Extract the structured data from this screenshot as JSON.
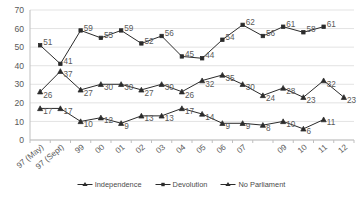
{
  "chart_data": {
    "type": "line",
    "title": "",
    "subtitle": "",
    "xlabel": "",
    "ylabel": "",
    "ylim": [
      0,
      70
    ],
    "ytick_step": 10,
    "yticks": [
      "0",
      "10",
      "20",
      "30",
      "40",
      "50",
      "60",
      "70"
    ],
    "grid": true,
    "grid_axis": "y",
    "legend_position": "bottom",
    "categories": [
      "97 (May)",
      "97 (Sept)",
      "99",
      "00",
      "01",
      "02",
      "03",
      "04",
      "05",
      "06",
      "07",
      "08",
      "09",
      "10",
      "11",
      "12"
    ],
    "xtick_labels_visible": [
      "97 (May)",
      "97 (Sept)",
      "99",
      "00",
      "01",
      "02",
      "03",
      "04",
      "05",
      "06",
      "07",
      "",
      "09",
      "10",
      "11",
      "12"
    ],
    "series": [
      {
        "name": "Independence",
        "marker": "triangle",
        "color": "#000000",
        "values": [
          26,
          37,
          27,
          30,
          30,
          27,
          30,
          26,
          32,
          35,
          30,
          24,
          28,
          23,
          32,
          23
        ],
        "labels": [
          "26",
          "37",
          "27",
          "30",
          "30",
          "27",
          "30",
          "26",
          "32",
          "35",
          "30",
          "24",
          "28",
          "23",
          "32",
          "23"
        ]
      },
      {
        "name": "Devolution",
        "marker": "square",
        "color": "#000000",
        "values": [
          51,
          41,
          59,
          55,
          59,
          52,
          56,
          45,
          44,
          54,
          62,
          56,
          61,
          58,
          61,
          null
        ],
        "labels": [
          "51",
          "41",
          "59",
          "55",
          "59",
          "52",
          "56",
          "45",
          "44",
          "54",
          "62",
          "56",
          "61",
          "58",
          "61",
          ""
        ]
      },
      {
        "name": "No Parliament",
        "marker": "triangle",
        "color": "#000000",
        "values": [
          17,
          17,
          10,
          12,
          9,
          13,
          13,
          17,
          14,
          9,
          9,
          8,
          10,
          6,
          11,
          null
        ],
        "labels": [
          "17",
          "17",
          "10",
          "12",
          "9",
          "13",
          "13",
          "17",
          "14",
          "9",
          "9",
          "8",
          "10",
          "6",
          "11",
          ""
        ]
      }
    ]
  },
  "legend": {
    "items": [
      {
        "label": "Independence",
        "marker": "triangle"
      },
      {
        "label": "Devolution",
        "marker": "square"
      },
      {
        "label": "No Parliament",
        "marker": "triangle"
      }
    ]
  },
  "colors": {
    "line": "#2b2b2b",
    "grid": "#e3e3e3",
    "axis": "#bfbfbf",
    "text": "#595959"
  }
}
